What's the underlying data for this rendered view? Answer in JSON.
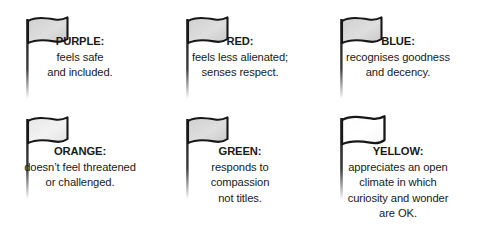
{
  "page": {
    "background_color": "#ffffff",
    "text_color": "#1a1a1a",
    "flag_outline_color": "#1b1b1b",
    "flag_fill_color": "#d8d8d8",
    "flag_fill_color_light": "#fafafa",
    "pole_color": "#222222"
  },
  "cells": [
    {
      "icon": "flag-icon",
      "label": "PURPLE:",
      "lines": [
        "feels safe",
        "and included."
      ]
    },
    {
      "icon": "flag-icon",
      "label": "RED:",
      "lines": [
        "feels less alienated;",
        "senses respect."
      ]
    },
    {
      "icon": "flag-icon",
      "label": "BLUE:",
      "lines": [
        "recognises goodness",
        "and decency."
      ]
    },
    {
      "icon": "flag-icon",
      "label": "ORANGE:",
      "lines": [
        "doesn’t feel threatened",
        "or challenged."
      ]
    },
    {
      "icon": "flag-icon",
      "label": "GREEN:",
      "lines": [
        "responds to",
        "compassion",
        "not titles."
      ]
    },
    {
      "icon": "flag-icon",
      "label": "YELLOW:",
      "lines": [
        "appreciates an open",
        "climate in which",
        "curiosity and wonder",
        "are OK."
      ]
    }
  ]
}
